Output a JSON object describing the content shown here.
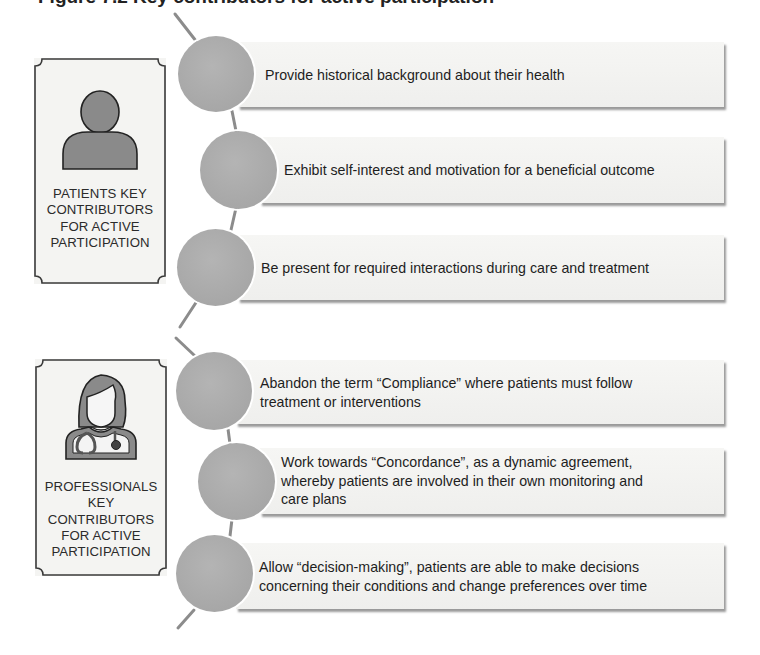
{
  "figure": {
    "title_clipped": "Figure 7.2    Key contributors for active participation"
  },
  "groups": [
    {
      "id": "patients",
      "label_lines": [
        "PATIENTS KEY",
        "CONTRIBUTORS",
        "FOR ACTIVE",
        "PARTICIPATION"
      ],
      "icon": "person-icon",
      "items": [
        {
          "text": "Provide historical background about their health"
        },
        {
          "text": "Exhibit self-interest and motivation for a beneficial outcome"
        },
        {
          "text": "Be present for required interactions during care and treatment"
        }
      ]
    },
    {
      "id": "professionals",
      "label_lines": [
        "PROFESSIONALS",
        "KEY",
        "CONTRIBUTORS",
        "FOR ACTIVE",
        "PARTICIPATION"
      ],
      "icon": "doctor-stethoscope-icon",
      "items": [
        {
          "text_lines": [
            "Abandon the term “Compliance” where patients must follow",
            "treatment or interventions"
          ]
        },
        {
          "text_lines": [
            "Work towards “Concordance”, as a dynamic agreement,",
            "whereby patients are involved in their own monitoring and",
            "care plans"
          ]
        },
        {
          "text_lines": [
            "Allow “decision-making”, patients are able to make decisions",
            "concerning their conditions and change preferences over time"
          ]
        }
      ]
    }
  ],
  "colors": {
    "circle_fill": "#aaaaaa",
    "icon_fill": "#8a8a8a",
    "banner_fill": "#f3f3f1",
    "connector": "#8c8c8c",
    "box_border": "#3a3a3a"
  }
}
